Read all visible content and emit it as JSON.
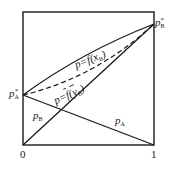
{
  "diagram": {
    "labels": {
      "pA_star": {
        "base": "p",
        "sub": "A",
        "sup": "*"
      },
      "pB_star": {
        "base": "p",
        "sub": "B",
        "sup": "*"
      },
      "pA_line": {
        "base": "p",
        "sub": "A"
      },
      "pB_line": {
        "base": "p",
        "sub": "B"
      },
      "bubble_curve": {
        "prefix": "p=f(x",
        "sub": "B",
        "suffix": ")"
      },
      "dew_curve": {
        "prefix": "p=",
        "f": "f",
        "open": "(",
        "var": "y",
        "sub": "B",
        "suffix": ")"
      }
    },
    "axis": {
      "x_min_label": "0",
      "x_max_label": "1"
    },
    "colors": {
      "line": "#1a1a1a",
      "background": "#ffffff"
    }
  }
}
